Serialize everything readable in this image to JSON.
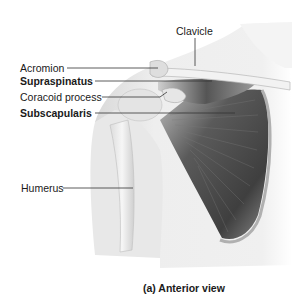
{
  "figure": {
    "caption": "(a) Anterior view",
    "labels": [
      {
        "id": "clavicle",
        "text": "Clavicle",
        "bold": false
      },
      {
        "id": "acromion",
        "text": "Acromion",
        "bold": false
      },
      {
        "id": "supraspinatus",
        "text": "Supraspinatus",
        "bold": true
      },
      {
        "id": "coracoid",
        "text": "Coracoid process",
        "bold": false
      },
      {
        "id": "subscapularis",
        "text": "Subscapularis",
        "bold": true
      },
      {
        "id": "humerus",
        "text": "Humerus",
        "bold": false
      }
    ]
  },
  "colors": {
    "background": "#ffffff",
    "skin_tone": "#ececec",
    "bone": "#f3f3f3",
    "muscle_dark": "#4a4a4a",
    "leader_line": "#333333",
    "text": "#1a1a1a"
  }
}
